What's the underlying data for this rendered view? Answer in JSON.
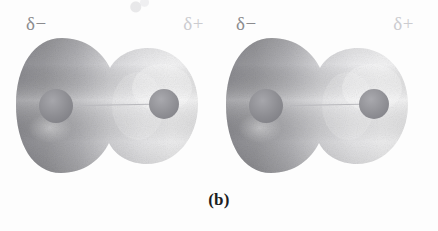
{
  "figure": {
    "caption": "(b)",
    "kind": "electron-density-diagram",
    "molecule_count": 2,
    "colors": {
      "background": "#fdfdfd",
      "cloud_dense": "#9a9a9e",
      "cloud_light": "#f4f4f5",
      "nucleus": "#8f8f93",
      "bond_axis": "#b9b9bd",
      "label_negative": "#8b8b8e",
      "label_positive": "#ccccd0",
      "caption": "#1d1d1f"
    }
  },
  "molecules": [
    {
      "id": "molecule-left",
      "labels": {
        "negative_end": "δ−",
        "positive_end": "δ+"
      },
      "atoms": [
        {
          "id": "atom-negative",
          "side": "left",
          "radius_px": 17
        },
        {
          "id": "atom-positive",
          "side": "right",
          "radius_px": 15
        }
      ],
      "bond": {
        "type": "polar-covalent",
        "axis": "horizontal"
      }
    },
    {
      "id": "molecule-right",
      "labels": {
        "negative_end": "δ−",
        "positive_end": "δ+"
      },
      "atoms": [
        {
          "id": "atom-negative",
          "side": "left",
          "radius_px": 17
        },
        {
          "id": "atom-positive",
          "side": "right",
          "radius_px": 15
        }
      ],
      "bond": {
        "type": "polar-covalent",
        "axis": "horizontal"
      }
    }
  ]
}
